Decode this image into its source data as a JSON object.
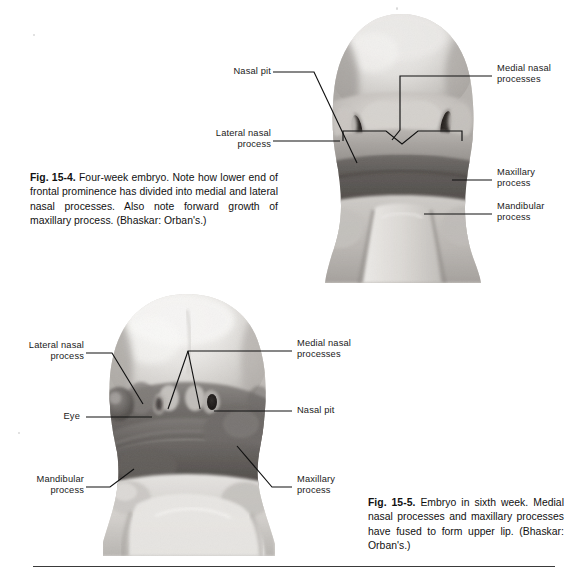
{
  "page": {
    "background_color": "#ffffff",
    "ink_color": "#111111",
    "bottom_rule_color": "#3a3a3a"
  },
  "figures": [
    {
      "id": "fig-15-4",
      "number": "Fig. 15-4.",
      "caption_body": " Four-week embryo. Note how lower end of frontal prominence has divided into medial and lateral nasal processes. Also note forward growth of maxillary process. (Bhaskar: Orban's.)",
      "subject": "four-week-embryo-frontal-view",
      "labels": [
        {
          "id": "nasal-pit",
          "lines": [
            "Nasal pit"
          ],
          "align": "right"
        },
        {
          "id": "lateral-nasal",
          "lines": [
            "Lateral nasal",
            "process"
          ],
          "align": "right"
        },
        {
          "id": "medial-nasal",
          "lines": [
            "Medial nasal",
            "processes"
          ],
          "align": "left"
        },
        {
          "id": "maxillary",
          "lines": [
            "Maxillary",
            "process"
          ],
          "align": "left"
        },
        {
          "id": "mandibular",
          "lines": [
            "Mandibular",
            "process"
          ],
          "align": "left"
        }
      ]
    },
    {
      "id": "fig-15-5",
      "number": "Fig. 15-5.",
      "caption_body": " Embryo in sixth week. Medial nasal processes and maxillary processes have fused to form upper lip. (Bhaskar: Orban's.)",
      "subject": "sixth-week-embryo-frontal-view",
      "labels": [
        {
          "id": "lateral-nasal",
          "lines": [
            "Lateral nasal",
            "process"
          ],
          "align": "right"
        },
        {
          "id": "eye",
          "lines": [
            "Eye"
          ],
          "align": "right"
        },
        {
          "id": "mandibular",
          "lines": [
            "Mandibular",
            "process"
          ],
          "align": "right"
        },
        {
          "id": "medial-nasal",
          "lines": [
            "Medial nasal",
            "processes"
          ],
          "align": "left"
        },
        {
          "id": "nasal-pit",
          "lines": [
            "Nasal pit"
          ],
          "align": "left"
        },
        {
          "id": "maxillary",
          "lines": [
            "Maxillary",
            "process"
          ],
          "align": "left"
        }
      ]
    }
  ]
}
